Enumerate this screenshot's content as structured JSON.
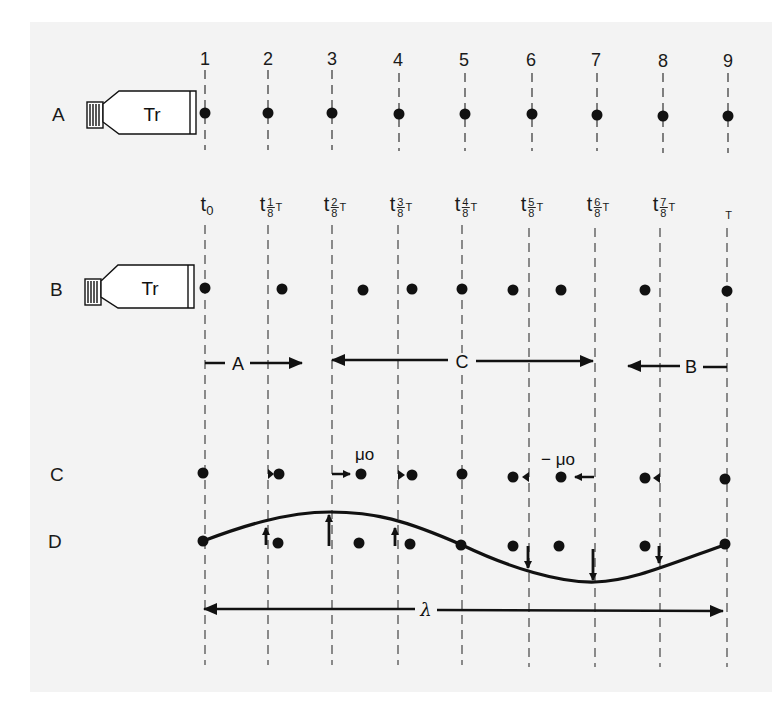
{
  "figure": {
    "rows": [
      {
        "id": "A",
        "label": "A",
        "has_transducer": true
      },
      {
        "id": "B",
        "label": "B",
        "has_transducer": true
      },
      {
        "id": "C",
        "label": "C",
        "has_transducer": false
      },
      {
        "id": "D",
        "label": "D",
        "has_transducer": false
      }
    ],
    "transducer_label": "Tr",
    "column_numbers": [
      "1",
      "2",
      "3",
      "4",
      "5",
      "6",
      "7",
      "8",
      "9"
    ],
    "time_labels": [
      {
        "t": "t",
        "sub": "0",
        "num": "",
        "den": "",
        "T": ""
      },
      {
        "t": "t",
        "sub": "",
        "num": "1",
        "den": "8",
        "T": "T"
      },
      {
        "t": "t",
        "sub": "",
        "num": "2",
        "den": "8",
        "T": "T"
      },
      {
        "t": "t",
        "sub": "",
        "num": "3",
        "den": "8",
        "T": "T"
      },
      {
        "t": "t",
        "sub": "",
        "num": "4",
        "den": "8",
        "T": "T"
      },
      {
        "t": "t",
        "sub": "",
        "num": "5",
        "den": "8",
        "T": "T"
      },
      {
        "t": "t",
        "sub": "",
        "num": "6",
        "den": "8",
        "T": "T"
      },
      {
        "t": "t",
        "sub": "",
        "num": "7",
        "den": "8",
        "T": "T"
      },
      {
        "t": "",
        "sub": "",
        "num": "",
        "den": "",
        "T": "T"
      }
    ],
    "region_arrows": [
      {
        "label": "A",
        "direction": "right",
        "from_col": 1,
        "to_col": 2.6
      },
      {
        "label": "C",
        "direction": "both",
        "from_col": 3,
        "to_col": 7
      },
      {
        "label": "B",
        "direction": "left",
        "from_col": 7.5,
        "to_col": 9
      }
    ],
    "velocity_labels": {
      "positive": "μo",
      "negative": "− μo"
    },
    "wavelength_label": "λ",
    "columns_x": [
      205,
      268,
      332,
      398,
      462,
      529,
      595,
      660,
      727
    ],
    "row_y": {
      "numbers": 58,
      "A": 114,
      "tlabels": 205,
      "B": 290,
      "arrows": 362,
      "C": 474,
      "D": 540,
      "lambda": 609
    },
    "row_B_dot_x": [
      205,
      282,
      363,
      412,
      462,
      513,
      561,
      645,
      727
    ],
    "row_C_dot_x": [
      205,
      278,
      361,
      412,
      462,
      513,
      561,
      647,
      727
    ],
    "row_D_dot_x": [
      205,
      278,
      361,
      412,
      462,
      513,
      561,
      647,
      727
    ],
    "row_D_dot_y": [
      540,
      542,
      542,
      542,
      545,
      546,
      546,
      544,
      544
    ],
    "curve_points": [
      [
        205,
        540
      ],
      [
        268,
        521
      ],
      [
        332,
        512
      ],
      [
        398,
        521
      ],
      [
        462,
        545
      ],
      [
        529,
        570
      ],
      [
        595,
        582
      ],
      [
        660,
        566
      ],
      [
        727,
        544
      ]
    ],
    "colors": {
      "ink": "#111111",
      "background": "#f3f3f3",
      "page": "#ffffff"
    }
  }
}
